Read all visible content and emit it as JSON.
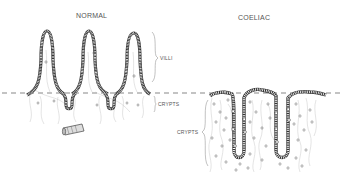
{
  "diagram": {
    "panels": [
      {
        "id": "normal",
        "title": "NORMAL",
        "labels": {
          "villi": "VILLI",
          "crypts": "CRYPTS"
        }
      },
      {
        "id": "coeliac",
        "title": "COELIAC",
        "labels": {
          "crypts": "CRYPTS"
        }
      }
    ],
    "colors": {
      "line": "#444444",
      "fill_light": "#e8e8e8",
      "background": "#ffffff"
    }
  }
}
